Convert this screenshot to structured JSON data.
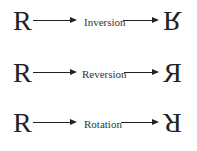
{
  "diagram": {
    "source_glyph": "R",
    "rows": [
      {
        "transform": "Inversion",
        "result_glyph": "R",
        "result_description": "R flipped vertically (upside down)"
      },
      {
        "transform": "Reversion",
        "result_glyph": "R",
        "result_description": "R mirrored horizontally"
      },
      {
        "transform": "Rotation",
        "result_glyph": "R",
        "result_description": "R rotated 180 degrees"
      }
    ]
  }
}
